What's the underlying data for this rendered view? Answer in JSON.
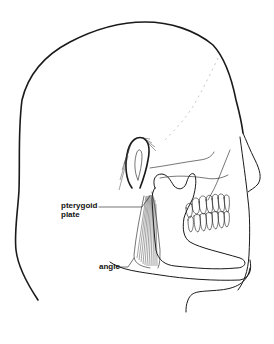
{
  "figure": {
    "labels": {
      "pterygoid_plate_line1": "pterygoid",
      "pterygoid_plate_line2": "plate",
      "angle": "angle"
    }
  }
}
